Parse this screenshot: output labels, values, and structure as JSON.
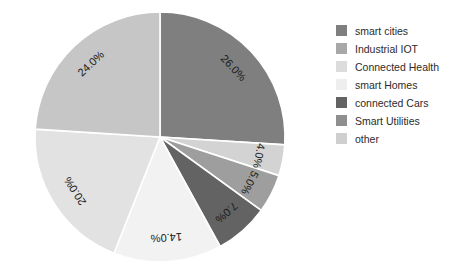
{
  "chart_data": {
    "type": "pie",
    "title": "",
    "subtitle": "",
    "xlabel": "",
    "ylabel": "",
    "legend_position": "right",
    "grid": false,
    "start_angle_deg": 90,
    "direction": "clockwise",
    "categories": [
      "smart cities",
      "Industrial IOT",
      "Connected Health",
      "smart Homes",
      "connected Cars",
      "Smart Utilities",
      "other"
    ],
    "values": [
      26.0,
      4.0,
      5.0,
      7.0,
      14.0,
      20.0,
      24.0
    ],
    "labels": [
      "26.0%",
      "4.0%",
      "5.0%",
      "7.0%",
      "14.0%",
      "20.0%",
      "24.0%"
    ],
    "colors": [
      "#7f7f7f",
      "#d3d3d3",
      "#9e9e9e",
      "#636363",
      "#f2f2f2",
      "#e2e2e2",
      "#c6c6c6"
    ],
    "total": 100.0,
    "value_unit": "percent"
  },
  "legend": {
    "items": [
      {
        "label": "smart cities",
        "color": "#7f7f7f"
      },
      {
        "label": "Industrial IOT",
        "color": "#a8a8a8"
      },
      {
        "label": "Connected Health",
        "color": "#dcdcdc"
      },
      {
        "label": "smart Homes",
        "color": "#eeeeee"
      },
      {
        "label": "connected Cars",
        "color": "#636363"
      },
      {
        "label": "Smart Utilities",
        "color": "#8f8f8f"
      },
      {
        "label": "other",
        "color": "#cfcfcf"
      }
    ]
  },
  "slice_labels": {
    "s0": "26.0%",
    "s1": "4.0%",
    "s2": "5.0%",
    "s3": "7.0%",
    "s4": "14.0%",
    "s5": "20.0%",
    "s6": "24.0%"
  }
}
